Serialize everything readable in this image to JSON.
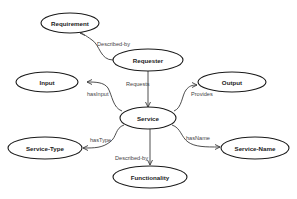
{
  "diagram": {
    "type": "ontology-graph",
    "nodes": [
      {
        "id": "requirement",
        "label": "Requirement",
        "cx": 70,
        "cy": 23,
        "rx": 29,
        "ry": 10
      },
      {
        "id": "requester",
        "label": "Requester",
        "cx": 148,
        "cy": 60,
        "rx": 35,
        "ry": 11
      },
      {
        "id": "input",
        "label": "Input",
        "cx": 47,
        "cy": 82,
        "rx": 31,
        "ry": 10
      },
      {
        "id": "output",
        "label": "Output",
        "cx": 232,
        "cy": 82,
        "rx": 34,
        "ry": 10
      },
      {
        "id": "service",
        "label": "Service",
        "cx": 148,
        "cy": 118,
        "rx": 28,
        "ry": 11
      },
      {
        "id": "service-type",
        "label": "Service-Type",
        "cx": 45,
        "cy": 148,
        "rx": 37,
        "ry": 11
      },
      {
        "id": "service-name",
        "label": "Service-Name",
        "cx": 255,
        "cy": 148,
        "rx": 34,
        "ry": 11
      },
      {
        "id": "functionality",
        "label": "Functionality",
        "cx": 150,
        "cy": 177,
        "rx": 37,
        "ry": 11
      }
    ],
    "edges": [
      {
        "from": "requester",
        "to": "requirement",
        "label": "Described-by"
      },
      {
        "from": "requester",
        "to": "service",
        "label": "Requests"
      },
      {
        "from": "service",
        "to": "input",
        "label": "hasInput"
      },
      {
        "from": "service",
        "to": "output",
        "label": "Provides"
      },
      {
        "from": "service",
        "to": "service-type",
        "label": "hasType"
      },
      {
        "from": "service",
        "to": "service-name",
        "label": "hasName"
      },
      {
        "from": "service",
        "to": "functionality",
        "label": "Described-by"
      }
    ]
  }
}
